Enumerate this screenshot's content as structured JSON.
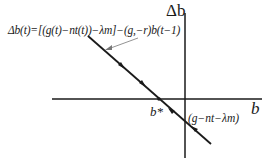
{
  "diagram": {
    "type": "phase-diagram",
    "axes": {
      "y_label": "Δb",
      "x_label": "b"
    },
    "equation_label": "Δb(t)=[(g(t)−nt(t))−λm]−(g,−r)b(t−1)",
    "equilibrium_label": "b*",
    "intercept_label": "(g−nt−λm)",
    "line": {
      "slope": "negative",
      "arrows_direction": "toward b*",
      "arrow_count": 4
    },
    "colors": {
      "line": "#1a1a1a",
      "background": "#ffffff",
      "pointer": "#777777"
    }
  }
}
